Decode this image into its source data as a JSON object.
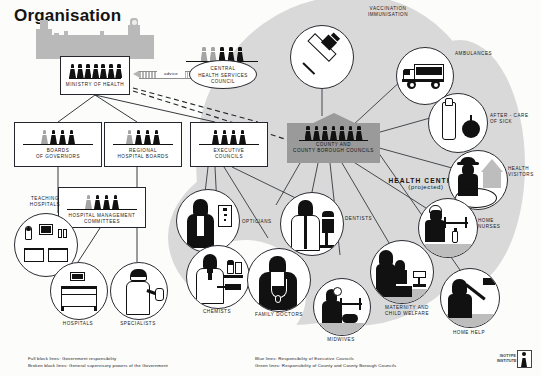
{
  "title": "Organisation",
  "advice": {
    "label": "advice"
  },
  "boxes": [
    {
      "id": "ministry",
      "name": "ministry-of-health",
      "lines": [
        "MINISTRY OF HEALTH"
      ],
      "figures": 7,
      "grey_first": 0
    },
    {
      "id": "governors",
      "name": "boards-of-governors",
      "lines": [
        "BOARDS",
        "OF GOVERNORS"
      ],
      "figures": 4,
      "grey_first": 1
    },
    {
      "id": "regional",
      "name": "regional-hospital-boards",
      "lines": [
        "REGIONAL",
        "HOSPITAL BOARDS"
      ],
      "figures": 4,
      "grey_first": 1
    },
    {
      "id": "executive",
      "name": "executive-councils",
      "lines": [
        "EXECUTIVE",
        "COUNCILS"
      ],
      "figures": 4,
      "grey_first": 0
    },
    {
      "id": "hmc",
      "name": "hospital-management-committees",
      "lines": [
        "HOSPITAL MANAGEMENT",
        "COMMITTEES"
      ],
      "figures": 4,
      "grey_first": 1
    }
  ],
  "chsc": {
    "lines": [
      "CENTRAL",
      "HEALTH SERVICES",
      "COUNCIL"
    ],
    "figures": 5,
    "grey_first": 2
  },
  "county": {
    "lines": [
      "COUNTY AND",
      "COUNTY BOROUGH COUNCILS"
    ],
    "figures": 7
  },
  "health_centres": {
    "line1": "HEALTH CENTRES",
    "line2": "(projected)"
  },
  "circles": [
    {
      "name": "teaching-hospitals",
      "label": "TEACHING\nHOSPITALS",
      "icon": "ward-beds-icon"
    },
    {
      "name": "hospitals",
      "label": "HOSPITALS",
      "icon": "hospital-bed-icon"
    },
    {
      "name": "specialists",
      "label": "SPECIALISTS",
      "icon": "surgeon-icon"
    },
    {
      "name": "opticians",
      "label": "OPTICIANS",
      "icon": "optician-eyechart-icon"
    },
    {
      "name": "chemists",
      "label": "CHEMISTS",
      "icon": "pharmacist-icon"
    },
    {
      "name": "family-doctors",
      "label": "FAMILY DOCTORS",
      "icon": "doctor-stethoscope-icon"
    },
    {
      "name": "dentists",
      "label": "DENTISTS",
      "icon": "dentist-chair-icon"
    },
    {
      "name": "midwives",
      "label": "MIDWIVES",
      "icon": "midwife-baby-icon"
    },
    {
      "name": "maternity-and-child-welfare",
      "label": "MATERNITY AND\nCHILD WELFARE",
      "icon": "mother-child-scales-icon"
    },
    {
      "name": "vaccination-immunisation",
      "label": "VACCINATION\nIMMUNISATION",
      "icon": "syringe-icon"
    },
    {
      "name": "ambulances",
      "label": "AMBULANCES",
      "icon": "ambulance-icon"
    },
    {
      "name": "after-care-of-sick",
      "label": "AFTER - CARE\nOF SICK",
      "icon": "milk-bottle-apple-icon"
    },
    {
      "name": "health-visitors",
      "label": "HEALTH\nVISITORS",
      "icon": "visitor-house-icon"
    },
    {
      "name": "home-nurses",
      "label": "HOME\nNURSES",
      "icon": "nurse-bedside-icon"
    },
    {
      "name": "home-help",
      "label": "HOME HELP",
      "icon": "home-help-broom-icon"
    }
  ],
  "legend": {
    "left": [
      "Full block lines:  Government responsibility",
      "Broken black lines:  General supervisory powers of the Government"
    ],
    "right": [
      "Blue lines:  Responsibility of Executive Councils",
      "Green lines:  Responsibility of County and County Borough Councils"
    ]
  },
  "credit": {
    "line1": "ISOTYPE",
    "line2": "INSTITUTE"
  },
  "colors": {
    "ink": "#111111",
    "grey_figure": "#a5a5a5",
    "blob": "#d9d9d9",
    "authority": "#9a9a9a",
    "palace": "#b9b9b9"
  }
}
